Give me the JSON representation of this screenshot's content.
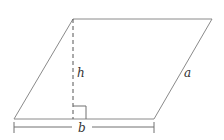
{
  "figure": {
    "shape": "parallelogram",
    "labels": {
      "height": "h",
      "side": "a",
      "base": "b"
    },
    "features": {
      "height_line_style": "dashed",
      "right_angle_marker": true,
      "base_dimension_line": true
    }
  }
}
